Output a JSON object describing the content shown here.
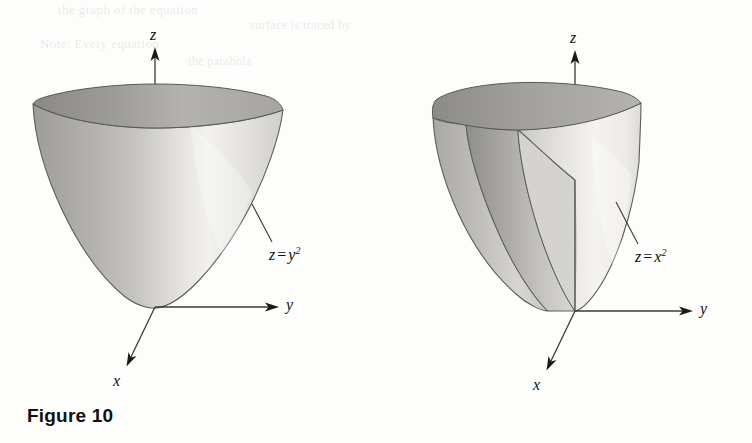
{
  "page": {
    "width": 752,
    "height": 443,
    "background": "#fdfdfc",
    "ink": "#101010"
  },
  "bleed_through": [
    {
      "text": "the graph of the equation",
      "x": 58,
      "y": 6
    },
    {
      "text": "surface is traced by",
      "x": 250,
      "y": 22
    },
    {
      "text": "Note: Every equation",
      "x": 40,
      "y": 40
    },
    {
      "text": "the parabola",
      "x": 188,
      "y": 58
    }
  ],
  "figures": [
    {
      "id": "figure-10",
      "caption": "Figure 10",
      "surface_label": {
        "lhs": "z",
        "op": "=",
        "rhs": "y",
        "exponent": "2"
      },
      "equation_text": "z = y2",
      "axes": [
        {
          "name": "z",
          "label": "z"
        },
        {
          "name": "y",
          "label": "y"
        },
        {
          "name": "x",
          "label": "x"
        }
      ],
      "origin": {
        "x": 155,
        "y": 307
      },
      "colors": {
        "outline": "#5a5a58",
        "light": "#f2f1ef",
        "mid": "#c9c8c5",
        "dark": "#9a9996"
      }
    },
    {
      "id": "figure-11",
      "caption": "Figure 11",
      "surface_label": {
        "lhs": "z",
        "op": "=",
        "rhs": "x",
        "exponent": "2"
      },
      "equation_text": "z = x2",
      "axes": [
        {
          "name": "z",
          "label": "z"
        },
        {
          "name": "y",
          "label": "y"
        },
        {
          "name": "x",
          "label": "x"
        }
      ],
      "origin": {
        "x": 575,
        "y": 311
      },
      "colors": {
        "outline": "#5a5a58",
        "light": "#f2f1ef",
        "mid": "#c9c8c5",
        "dark": "#9a9996"
      }
    }
  ]
}
